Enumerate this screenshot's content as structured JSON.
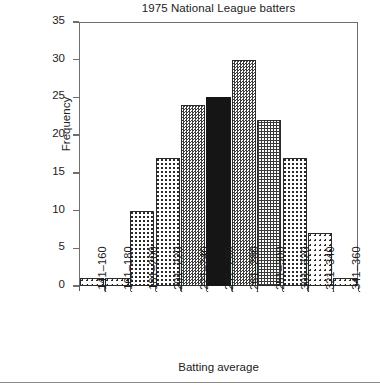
{
  "chart_data": {
    "type": "bar",
    "title": "1975 National League batters",
    "xlabel": "Batting average",
    "ylabel": "Frequency",
    "categories": [
      ".141–160",
      ".161–180",
      ".181–200",
      ".201–220",
      ".221–240",
      ".241–260",
      ".261–280",
      ".281–300",
      ".301–320",
      ".321–340",
      ".341–360"
    ],
    "values": [
      1,
      1,
      10,
      17,
      24,
      25,
      30,
      22,
      17,
      7,
      1
    ],
    "ylim": [
      0,
      35
    ],
    "yticks": [
      0,
      5,
      10,
      15,
      20,
      25,
      30,
      35
    ],
    "ytick_labels": [
      "0",
      "5",
      "10",
      "15",
      "20",
      "25",
      "30",
      "35"
    ],
    "grid": false,
    "legend": null,
    "bar_patterns": [
      "dots-sparse",
      "dots-sparse",
      "dots-med",
      "dots-med",
      "checker",
      "solid",
      "checker",
      "grid-fine",
      "dots-med",
      "dots-sparse",
      "dots-sparse"
    ],
    "colors": {
      "axis": "#6e6e6e",
      "bar_edge": "#2b2b2b",
      "bar_solid": "#151515",
      "text": "#1c1c1c",
      "background": "#ffffff"
    }
  }
}
